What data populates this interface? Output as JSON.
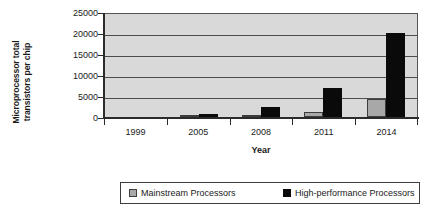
{
  "chart_data": {
    "type": "bar",
    "title": "",
    "subtitle": "",
    "xlabel": "Year",
    "ylabel": "Microprocessor total transistors per chip",
    "ylabel_line1": "Microprocessor total",
    "ylabel_line2": "transistors per chip",
    "categories": [
      "1999",
      "2005",
      "2008",
      "2011",
      "2014"
    ],
    "ylim": [
      0,
      25000
    ],
    "ytick_values": [
      25000,
      20000,
      15000,
      10000,
      5000,
      0
    ],
    "ytick_labels": [
      "25000",
      "20000",
      "15000",
      "10000",
      "5000",
      "0"
    ],
    "grid": true,
    "grid_axis": "y",
    "legend_position": "bottom",
    "series": [
      {
        "name": "Mainstream Processors",
        "color": "#a8a8a8",
        "values": [
          0,
          150,
          350,
          1300,
          4300
        ]
      },
      {
        "name": "High-performance Processors",
        "color": "#0a0a0a",
        "values": [
          0,
          800,
          2300,
          7000,
          20000
        ]
      }
    ],
    "plot_background": "#d9d9d9",
    "gridline_color": "#4d4d4d",
    "axis_color": "#2b2b2b"
  },
  "legend": {
    "items": [
      {
        "label": "Mainstream Processors",
        "swatch": "gray-square-icon"
      },
      {
        "label": "High-performance Processors",
        "swatch": "black-square-icon"
      }
    ]
  }
}
